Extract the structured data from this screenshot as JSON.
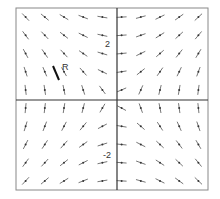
{
  "diagram": {
    "type": "slope-field",
    "equation_hint": "dy/dx = x / y",
    "x_range": [
      -4,
      4
    ],
    "y_range": [
      -4,
      4
    ],
    "grid_count": 10,
    "tick_labels": {
      "y_positive": "2",
      "y_negative": "-2"
    },
    "point_label": "R",
    "colors": {
      "frame": "#888888",
      "axes": "#333333",
      "segments": "#777777",
      "dots": "#333333",
      "highlight": "#111111"
    }
  }
}
